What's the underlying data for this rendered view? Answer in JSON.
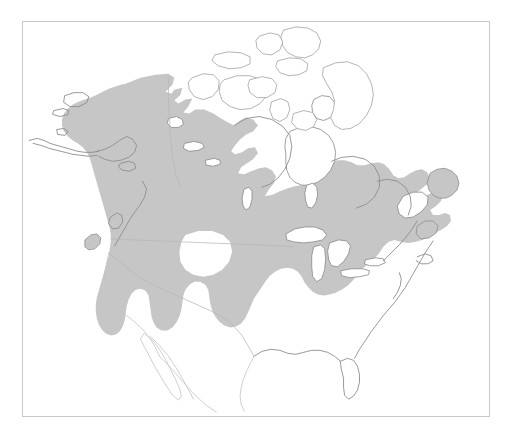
{
  "figure": {
    "type": "range-map",
    "title": "",
    "caption": "",
    "region": "North America",
    "background_color": "#ffffff"
  },
  "frame": {
    "visible": true,
    "border_color": "#c9c9c9",
    "x": 22,
    "y": 21,
    "width": 468,
    "height": 396
  },
  "legend": {
    "visible": false,
    "entries": [
      {
        "label": "Range",
        "color": "#c6c6c6"
      }
    ]
  },
  "map": {
    "projection_hint": "conic",
    "viewbox": "0 0 468 396",
    "colors": {
      "range_fill": "#c6c6c6",
      "coastline": "#8d8d8d",
      "coastline_faint": "#c4c4c4",
      "border_line": "#b6b6b6",
      "water": "#ffffff"
    },
    "features": {
      "shaded_range": {
        "name": "species-range",
        "fill": "#c6c6c6",
        "covers": [
          "Alaska",
          "Yukon",
          "Northwest Territories",
          "British Columbia",
          "Alberta",
          "Saskatchewan",
          "Manitoba",
          "Ontario",
          "Quebec",
          "Labrador",
          "Newfoundland",
          "Maritime Provinces",
          "Pacific Northwest",
          "Northern Rocky Mountains",
          "Great Lakes States",
          "New England",
          "Appalachians"
        ],
        "excludes": [
          "Canadian Arctic Archipelago",
          "Hudson Bay",
          "Great Lakes water",
          "Great Plains south",
          "Southwestern United States",
          "Southeastern United States",
          "Gulf Coast",
          "Florida",
          "Mexico",
          "Aleutian Islands"
        ]
      },
      "unshaded": {
        "name": "outside-range",
        "fill": "#ffffff"
      }
    },
    "labels": []
  },
  "annotations": []
}
